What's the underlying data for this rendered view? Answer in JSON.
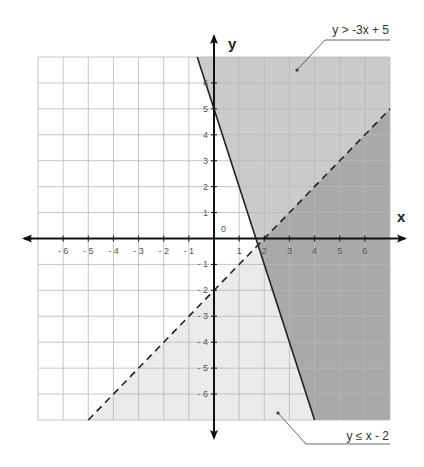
{
  "chart_data": {
    "type": "line",
    "title": "",
    "xlabel": "x",
    "ylabel": "y",
    "xlim": [
      -7,
      7
    ],
    "ylim": [
      -7,
      7
    ],
    "grid": true,
    "origin_label": "0",
    "x_ticks": [
      -6,
      -5,
      -4,
      -3,
      -2,
      -1,
      1,
      2,
      3,
      4,
      5,
      6
    ],
    "y_ticks": [
      -6,
      -5,
      -4,
      -3,
      -2,
      -1,
      1,
      2,
      3,
      4,
      5,
      6
    ],
    "x_tick_labels": [
      "- 6",
      "- 5",
      "- 4",
      "- 3",
      "- 2",
      "- 1",
      "1",
      "2",
      "3",
      "4",
      "5",
      "6"
    ],
    "y_tick_labels": [
      "- 6",
      "- 5",
      "- 4",
      "- 3",
      "- 2",
      "- 1",
      "1",
      "2",
      "3",
      "4",
      "5",
      "6"
    ],
    "series": [
      {
        "name": "y > -3x + 5",
        "style": "solid",
        "slope": -3,
        "intercept": 5,
        "shading": "above",
        "points": [
          [
            -0.667,
            7
          ],
          [
            4,
            -7
          ]
        ]
      },
      {
        "name": "y ≤ x - 2",
        "style": "dashed",
        "slope": 1,
        "intercept": -2,
        "shading": "below",
        "points": [
          [
            -5,
            -7
          ],
          [
            7,
            5
          ]
        ]
      }
    ],
    "intersection": [
      1.75,
      -0.25
    ],
    "annotations": [
      {
        "text": "y > -3x + 5",
        "points_to": [
          3.3,
          6.5
        ]
      },
      {
        "text": "y ≤ x - 2",
        "points_to": [
          2.5,
          -6.9
        ]
      }
    ],
    "colors": {
      "region_overlap": "#a9a9a9",
      "region_first_only": "#cbcbcb",
      "region_second_only": "#ebebeb",
      "grid": "#b8b8b8",
      "axes": "#111111",
      "lines": "#222222"
    }
  },
  "labels": {
    "x_axis": "x",
    "y_axis": "y",
    "origin": "0",
    "ineq1": "y > -3x + 5",
    "ineq2": "y ≤ x - 2"
  }
}
